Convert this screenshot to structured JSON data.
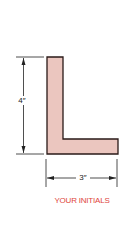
{
  "figure": {
    "shape": "L",
    "height_label": "4″",
    "width_label": "3″",
    "caption": "YOUR INITIALS",
    "colors": {
      "fill": "#ebc6bf",
      "stroke": "#2a1a18",
      "caption": "#e0463c",
      "dimension": "#222222"
    }
  }
}
